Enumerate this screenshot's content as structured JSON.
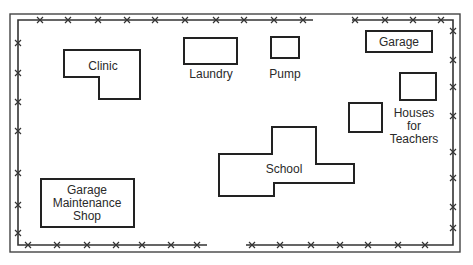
{
  "map": {
    "title": "School compound site plan",
    "buildings": [
      {
        "id": "clinic",
        "label": "Clinic"
      },
      {
        "id": "laundry",
        "label": "Laundry"
      },
      {
        "id": "pump",
        "label": "Pump"
      },
      {
        "id": "garage",
        "label": "Garage"
      },
      {
        "id": "houses",
        "label_lines": [
          "Houses",
          "for",
          "Teachers"
        ]
      },
      {
        "id": "school",
        "label": "School"
      },
      {
        "id": "maintenance",
        "label_lines": [
          "Garage",
          "Maintenance",
          "Shop"
        ]
      }
    ],
    "legend": {
      "fence": "fence-with-x-markers"
    }
  }
}
